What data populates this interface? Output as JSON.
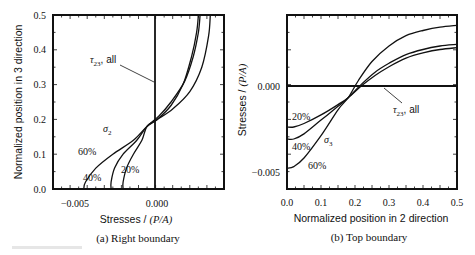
{
  "chart_data": [
    {
      "id": "a",
      "type": "line",
      "caption": "(a) Right boundary",
      "xlabel": "Stresses / (P/A)",
      "ylabel": "Normalized position in 3 direction",
      "xlim": [
        -0.0065,
        0.0035
      ],
      "ylim": [
        0.0,
        0.5
      ],
      "xticks": [
        "-0.005",
        "0.000"
      ],
      "yticks": [
        "0.0",
        "0.1",
        "0.2",
        "0.3",
        "0.4",
        "0.5"
      ],
      "grid": false,
      "orientation": "stress on x, position on y",
      "series": [
        {
          "name": "σ2 60%",
          "x": [
            -0.0047,
            -0.0046,
            -0.004,
            -0.003,
            -0.0018,
            -0.001,
            -0.0004,
            0.0004,
            0.0011,
            0.0016,
            0.0019,
            0.002
          ],
          "y": [
            0.0,
            0.02,
            0.06,
            0.1,
            0.14,
            0.18,
            0.2,
            0.24,
            0.3,
            0.38,
            0.45,
            0.5
          ]
        },
        {
          "name": "σ2 40%",
          "x": [
            -0.0031,
            -0.0031,
            -0.0029,
            -0.0024,
            -0.0016,
            -0.001,
            -0.0003,
            0.0004,
            0.0012,
            0.0017,
            0.002,
            0.0021
          ],
          "y": [
            0.0,
            0.02,
            0.06,
            0.1,
            0.14,
            0.18,
            0.21,
            0.25,
            0.31,
            0.38,
            0.45,
            0.5
          ]
        },
        {
          "name": "σ2 20%",
          "x": [
            -0.0024,
            -0.0024,
            -0.0022,
            -0.0018,
            -0.0013,
            -0.001,
            -0.0004,
            0.0005,
            0.0015,
            0.0022,
            0.0026,
            0.0027
          ],
          "y": [
            0.0,
            0.02,
            0.06,
            0.1,
            0.14,
            0.18,
            0.2,
            0.23,
            0.28,
            0.35,
            0.44,
            0.5
          ]
        },
        {
          "name": "τ23 all",
          "x": [
            0.0,
            0.0
          ],
          "y": [
            0.0,
            0.5
          ]
        }
      ],
      "annotations": [
        "τ23, all",
        "σ2",
        "60%",
        "40%",
        "20%"
      ]
    },
    {
      "id": "b",
      "type": "line",
      "caption": "(b) Top boundary",
      "xlabel": "Normalized position in 2 direction",
      "ylabel": "Stresses / (P/A)",
      "xlim": [
        0.0,
        0.5
      ],
      "ylim": [
        -0.006,
        0.0041
      ],
      "xticks": [
        "0.0",
        "0.1",
        "0.2",
        "0.3",
        "0.4",
        "0.5"
      ],
      "yticks": [
        "-0.005",
        "0.000"
      ],
      "grid": false,
      "series": [
        {
          "name": "σ3 20%",
          "x": [
            0.0,
            0.02,
            0.05,
            0.1,
            0.15,
            0.18,
            0.22,
            0.26,
            0.3,
            0.35,
            0.4,
            0.45,
            0.5
          ],
          "y": [
            -0.0024,
            -0.0024,
            -0.0022,
            -0.0017,
            -0.0011,
            -0.0007,
            0.0,
            0.0006,
            0.0011,
            0.0016,
            0.0019,
            0.0021,
            0.0022
          ]
        },
        {
          "name": "σ3 40%",
          "x": [
            0.0,
            0.02,
            0.05,
            0.1,
            0.15,
            0.18,
            0.22,
            0.26,
            0.3,
            0.35,
            0.4,
            0.45,
            0.5
          ],
          "y": [
            -0.0031,
            -0.0031,
            -0.0028,
            -0.002,
            -0.0012,
            -0.0007,
            0.0001,
            0.0008,
            0.0013,
            0.0018,
            0.0021,
            0.0023,
            0.0024
          ]
        },
        {
          "name": "σ3 60%",
          "x": [
            0.0,
            0.02,
            0.05,
            0.1,
            0.15,
            0.18,
            0.21,
            0.25,
            0.3,
            0.35,
            0.4,
            0.45,
            0.5
          ],
          "y": [
            -0.0048,
            -0.0047,
            -0.0042,
            -0.0029,
            -0.0014,
            -0.0007,
            0.0003,
            0.0014,
            0.0023,
            0.0029,
            0.0032,
            0.0034,
            0.0035
          ]
        },
        {
          "name": "τ23 all",
          "x": [
            0.0,
            0.5
          ],
          "y": [
            0.0,
            0.0
          ]
        }
      ],
      "annotations": [
        "τ23, all",
        "σ3",
        "20%",
        "40%",
        "60%"
      ]
    }
  ],
  "labels": {
    "a": {
      "caption": "(a) Right boundary",
      "xlabel_main": "Stresses / ",
      "xlabel_unit": "(P/A)",
      "ylabel": "Normalized position in 3 direction",
      "xticks": [
        "−0.005",
        "0.000"
      ],
      "yticks": [
        "0.0",
        "0.1",
        "0.2",
        "0.3",
        "0.4",
        "0.5"
      ],
      "tau_sub": "23",
      "tau_tail": ", all",
      "sigma_sub": "2",
      "pct60": "60%",
      "pct40": "40%",
      "pct20": "20%"
    },
    "b": {
      "caption": "(b) Top boundary",
      "xlabel": "Normalized position in 2 direction",
      "ylabel_main": "Stresses / ",
      "ylabel_unit": "(P/A)",
      "xticks": [
        "0.0",
        "0.1",
        "0.2",
        "0.3",
        "0.4",
        "0.5"
      ],
      "yticks": [
        "0.000",
        "−0.005"
      ],
      "tau_sub": "23",
      "tau_tail": ", all",
      "sigma_sub": "3",
      "pct20": "20%",
      "pct40": "40%",
      "pct60": "60%"
    }
  }
}
